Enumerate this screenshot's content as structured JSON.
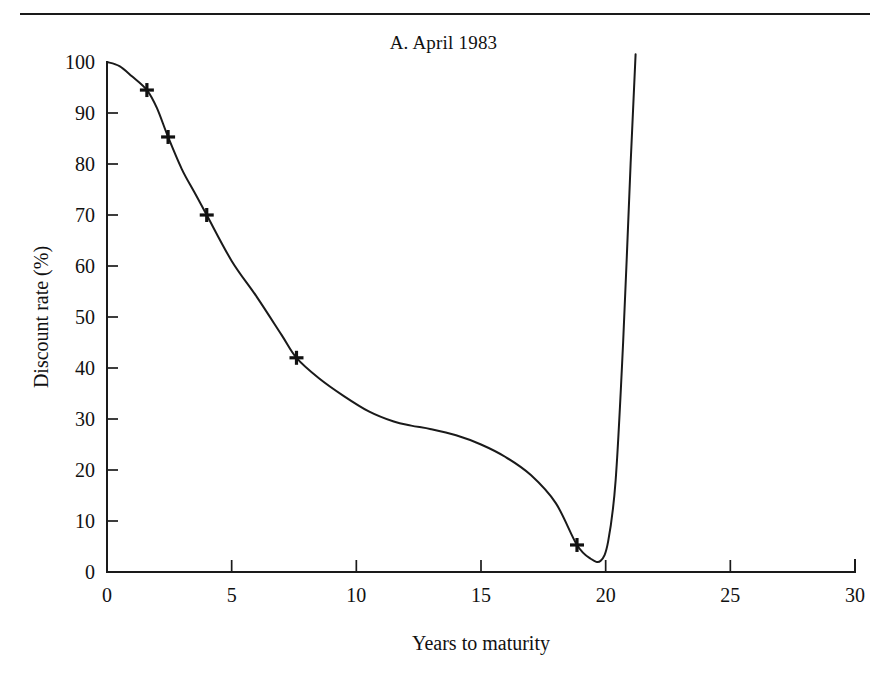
{
  "figure": {
    "title": "A.  April 1983",
    "rule_color": "#1a1a1a"
  },
  "chart_data": {
    "type": "line",
    "title": "A.  April 1983",
    "xlabel": "Years to maturity",
    "ylabel": "Discount rate (%)",
    "xlim": [
      0,
      30
    ],
    "ylim": [
      0,
      100
    ],
    "xticks": [
      0,
      5,
      10,
      15,
      20,
      25,
      30
    ],
    "yticks": [
      0,
      10,
      20,
      30,
      40,
      50,
      60,
      70,
      80,
      90,
      100
    ],
    "xtick_labels": [
      "0",
      "5",
      "10",
      "15",
      "20",
      "25",
      "30"
    ],
    "ytick_labels": [
      "0",
      "10",
      "20",
      "30",
      "40",
      "50",
      "60",
      "70",
      "80",
      "90",
      "100"
    ],
    "grid": false,
    "legend": null,
    "line_color": "#1a1a1a",
    "marker": "plus",
    "marker_color": "#111111",
    "series": [
      {
        "name": "Fitted discount function",
        "x": [
          0.0,
          0.5,
          1.0,
          1.6,
          2.0,
          2.45,
          3.0,
          3.5,
          4.0,
          5.0,
          6.0,
          7.0,
          7.6,
          8.5,
          9.5,
          10.5,
          11.5,
          12.2,
          13.0,
          14.0,
          15.0,
          16.0,
          17.0,
          18.0,
          18.85,
          19.4,
          19.8,
          20.1,
          20.4,
          20.7,
          21.0,
          21.2
        ],
        "y": [
          100.0,
          99.2,
          97.2,
          94.5,
          91.0,
          85.3,
          79.0,
          74.5,
          70.0,
          61.0,
          54.0,
          46.5,
          42.0,
          38.0,
          34.5,
          31.5,
          29.5,
          28.7,
          28.0,
          26.8,
          25.0,
          22.5,
          19.0,
          13.5,
          5.3,
          2.6,
          2.2,
          6.0,
          18.0,
          45.0,
          80.0,
          101.5
        ]
      }
    ],
    "markers": [
      {
        "x": 1.6,
        "y": 94.5
      },
      {
        "x": 2.45,
        "y": 85.3
      },
      {
        "x": 4.0,
        "y": 70.0
      },
      {
        "x": 7.6,
        "y": 42.0
      },
      {
        "x": 18.85,
        "y": 5.3
      }
    ]
  }
}
